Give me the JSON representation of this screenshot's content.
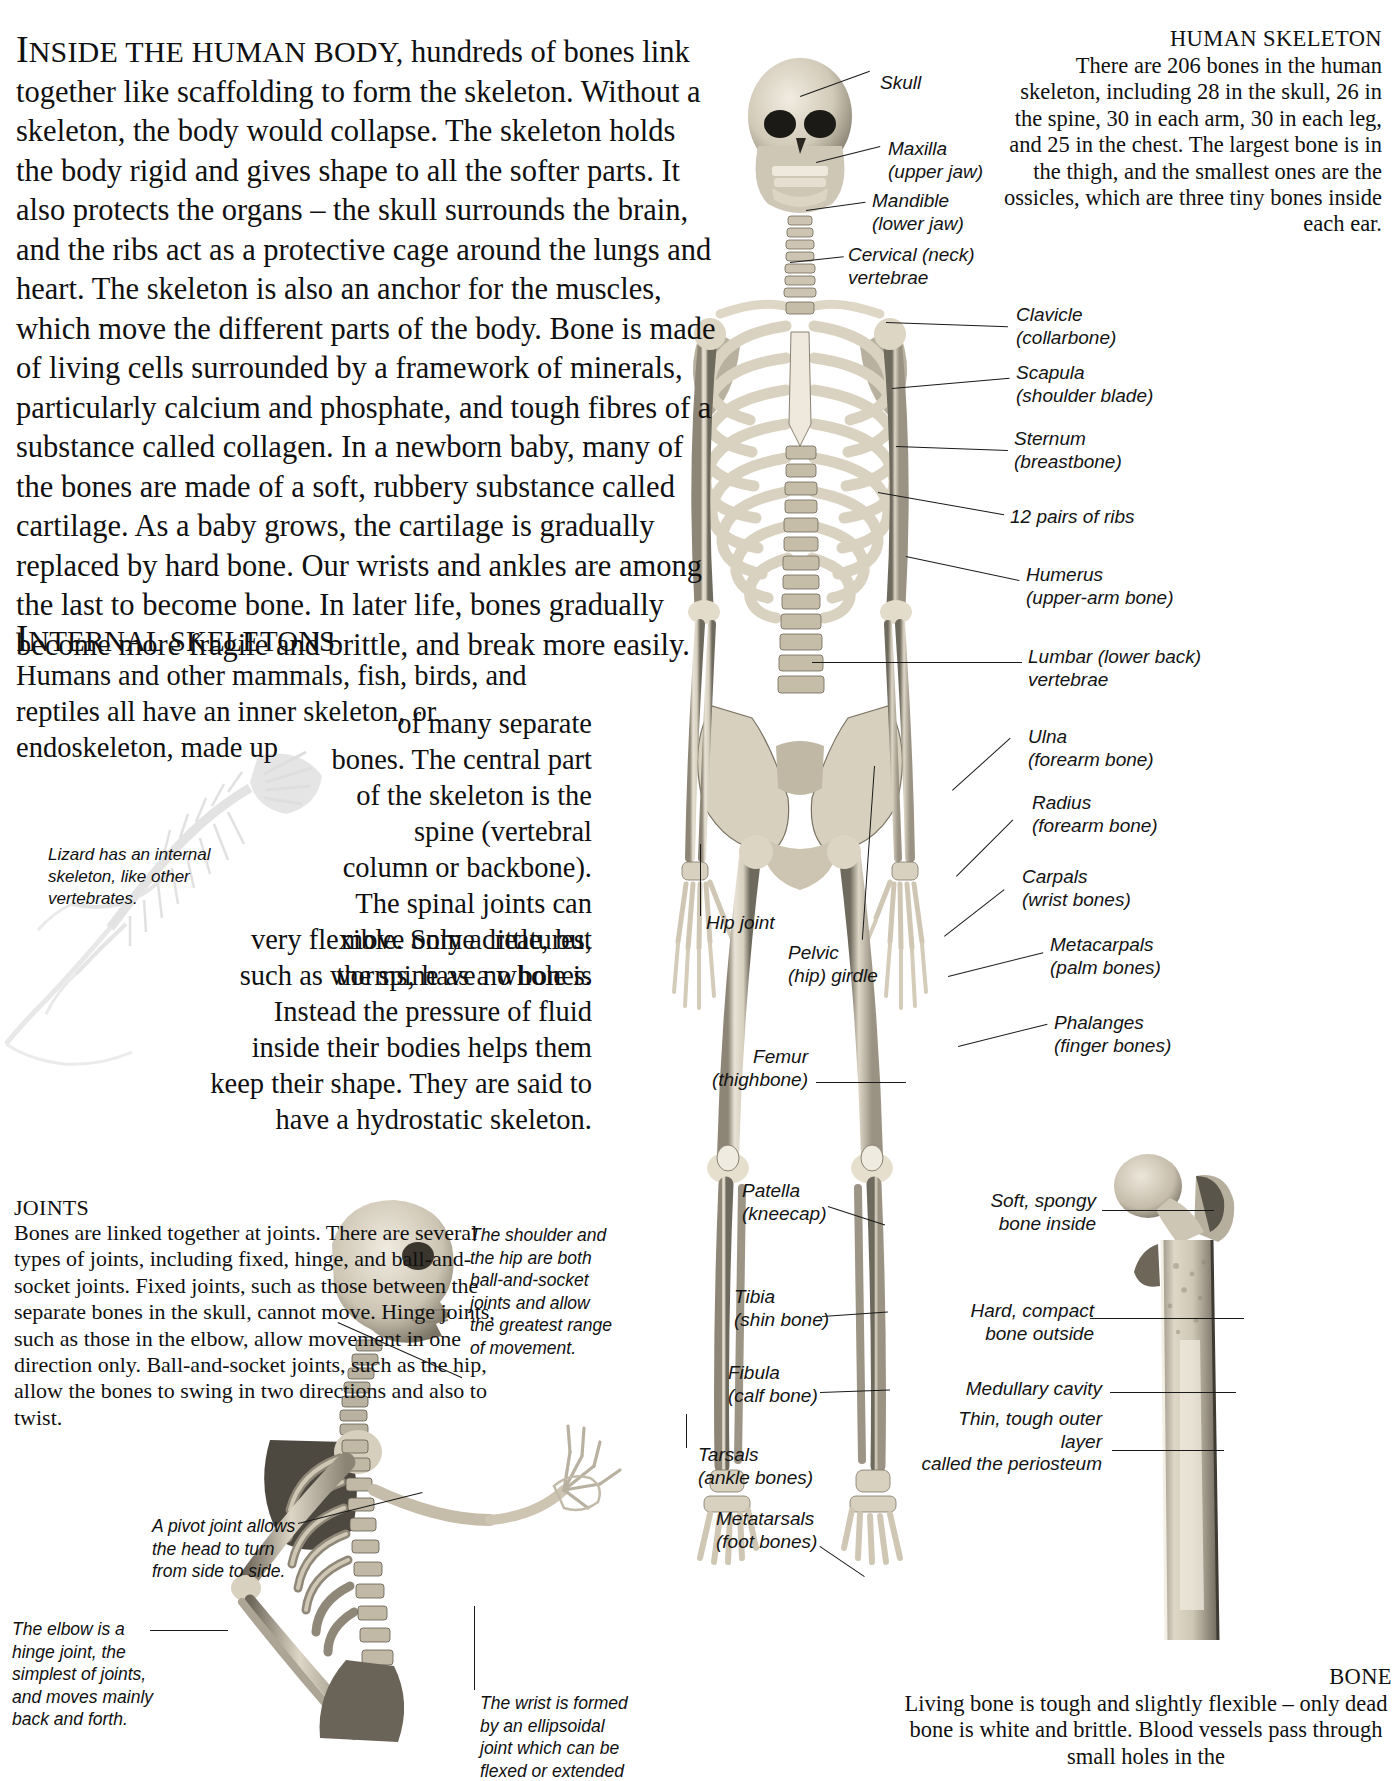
{
  "article": {
    "intro_lead_first": "I",
    "intro_lead_caps": "NSIDE THE HUMAN BODY,",
    "intro_body": " hundreds of bones link together like scaffolding to form the skeleton. Without a skeleton, the body would collapse. The skeleton holds the body rigid and gives shape to all the softer parts. It also protects the organs – the skull surrounds the brain, and the ribs act as a protective cage around the lungs and heart. The skeleton is also an anchor for the muscles, which move the different parts of the body. Bone is made of living cells surrounded by a framework of minerals, particularly calcium and phosphate, and tough fibres of a substance called collagen. In a newborn baby, many of the bones are made of a soft, rubbery substance called cartilage. As a baby grows, the cartilage is gradually replaced by hard bone. Our wrists and ankles are among the last to become bone. In later life, bones gradually become more fragile and brittle, and break more easily."
  },
  "internal_skeletons": {
    "head_first": "I",
    "head_caps": "NTERNAL SKELETONS",
    "lead": "Humans and other mammals, fish, birds, and reptiles all have an inner skeleton, or endoskeleton, made up",
    "wrap_top": "of many separate bones. The central part of the skeleton is the spine (vertebral column or backbone). The spinal joints can move only a little, but the spine as a whole is",
    "wrap_bottom": "very flexible. Some creatures, such as worms, have no bones. Instead the pressure of fluid inside their bodies helps them keep their shape. They are said to have a hydrostatic skeleton.",
    "lizard_caption": "Lizard has an internal skeleton, like other vertebrates."
  },
  "joints": {
    "head": "JOINTS",
    "body": "Bones are linked together at joints. There are several types of joints, including fixed, hinge, and ball-and-socket joints. Fixed joints, such as those between the separate bones in the skull, cannot move. Hinge joints, such as those in the elbow, allow movement in one direction only. Ball-and-socket joints, such as the hip, allow the bones to swing in two directions and also to twist.",
    "annotations": {
      "pivot": "A pivot joint allows the head to turn from side to side.",
      "elbow": "The elbow is a hinge joint, the simplest of joints, and moves mainly back and forth.",
      "shoulder": "The shoulder and the hip are both ball-and-socket joints and allow the greatest range of movement.",
      "wrist": "The wrist is formed by an ellipsoidal joint which can be flexed or extended"
    }
  },
  "human_skeleton_panel": {
    "title": "HUMAN SKELETON",
    "body": "There are 206 bones in the human skeleton, including 28 in the skull, 26 in the spine, 30 in each arm, 30 in each leg, and 25 in the chest. The largest bone is in the thigh, and the smallest ones are the ossicles, which are three tiny bones inside each ear."
  },
  "bone_panel": {
    "title": "BONE",
    "body": "Living bone is tough and slightly flexible – only dead bone is white and brittle. Blood vessels pass through small holes in the"
  },
  "skeleton_labels_left": [
    {
      "id": "hip-joint",
      "text": "Hip joint"
    },
    {
      "id": "pelvic-girdle",
      "text": "Pelvic\n(hip) girdle"
    },
    {
      "id": "femur",
      "text": "Femur\n(thighbone)"
    },
    {
      "id": "patella",
      "text": "Patella\n(kneecap)"
    },
    {
      "id": "tibia",
      "text": "Tibia\n(shin bone)"
    },
    {
      "id": "fibula",
      "text": "Fibula\n(calf bone)"
    },
    {
      "id": "tarsals",
      "text": "Tarsals\n(ankle bones)"
    },
    {
      "id": "metatarsals",
      "text": "Metatarsals\n(foot bones)"
    }
  ],
  "skeleton_labels_top": [
    {
      "id": "skull",
      "text": "Skull"
    },
    {
      "id": "maxilla",
      "text": "Maxilla\n(upper jaw)"
    },
    {
      "id": "mandible",
      "text": "Mandible\n(lower jaw)"
    },
    {
      "id": "cervical",
      "text": "Cervical (neck)\nvertebrae"
    }
  ],
  "skeleton_labels_right": [
    {
      "id": "clavicle",
      "text": "Clavicle\n(collarbone)"
    },
    {
      "id": "scapula",
      "text": "Scapula\n(shoulder blade)"
    },
    {
      "id": "sternum",
      "text": "Sternum\n(breastbone)"
    },
    {
      "id": "ribs",
      "text": "12 pairs of ribs"
    },
    {
      "id": "humerus",
      "text": "Humerus\n(upper-arm bone)"
    },
    {
      "id": "lumbar",
      "text": "Lumbar (lower back)\nvertebrae"
    },
    {
      "id": "ulna",
      "text": "Ulna\n(forearm bone)"
    },
    {
      "id": "radius",
      "text": "Radius\n(forearm bone)"
    },
    {
      "id": "carpals",
      "text": "Carpals\n(wrist bones)"
    },
    {
      "id": "metacarpals",
      "text": "Metacarpals\n(palm bones)"
    },
    {
      "id": "phalanges",
      "text": "Phalanges\n(finger bones)"
    }
  ],
  "bone_labels": [
    {
      "id": "spongy",
      "text": "Soft, spongy\nbone inside"
    },
    {
      "id": "compact",
      "text": "Hard, compact\nbone outside"
    },
    {
      "id": "medullary",
      "text": "Medullary cavity"
    },
    {
      "id": "periosteum",
      "text": "Thin, tough outer layer\ncalled the periosteum"
    }
  ],
  "colors": {
    "ink": "#101010",
    "leader": "#1a1a1a",
    "bone_light": "#e8e2d6",
    "bone_mid": "#c9c0ad",
    "bone_dark": "#8d8575",
    "bone_shadow": "#4a463e",
    "page_bg": "#ffffff"
  }
}
